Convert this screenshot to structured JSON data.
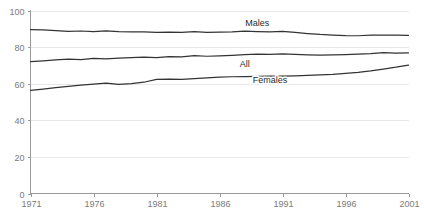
{
  "chart_data": {
    "type": "line",
    "title": "",
    "subtitle": "",
    "xlabel": "",
    "ylabel": "",
    "xlim": [
      1971,
      2001
    ],
    "ylim": [
      0,
      100
    ],
    "grid": true,
    "legend_position": "inline-labels",
    "y_ticks": [
      0,
      20,
      40,
      60,
      80,
      100
    ],
    "y_tick_labels": [
      "0",
      "20",
      "40",
      "60",
      "80",
      "100"
    ],
    "x_ticks": [
      1971,
      1976,
      1981,
      1986,
      1991,
      1996,
      2001
    ],
    "x_tick_labels": [
      "1971",
      "1976",
      "1981",
      "1986",
      "1991",
      "1996",
      "2001"
    ],
    "x": [
      1971,
      1972,
      1973,
      1974,
      1975,
      1976,
      1977,
      1978,
      1979,
      1980,
      1981,
      1982,
      1983,
      1984,
      1985,
      1986,
      1987,
      1988,
      1989,
      1990,
      1991,
      1992,
      1993,
      1994,
      1995,
      1996,
      1997,
      1998,
      1999,
      2000,
      2001
    ],
    "series": [
      {
        "name": "Males",
        "label": "Males",
        "color": "#333333",
        "label_x": 1989,
        "label_y": 93,
        "values": [
          89.6,
          89.4,
          89.0,
          88.6,
          88.8,
          88.5,
          88.9,
          88.4,
          88.3,
          88.3,
          88.1,
          88.2,
          88.0,
          88.4,
          88.0,
          88.2,
          88.3,
          88.7,
          88.5,
          88.3,
          88.6,
          88.0,
          87.4,
          86.9,
          86.6,
          86.3,
          86.2,
          86.5,
          86.6,
          86.5,
          86.4
        ]
      },
      {
        "name": "All",
        "label": "All",
        "color": "#333333",
        "label_x": 1988,
        "label_y": 71,
        "values": [
          72.1,
          72.5,
          73.0,
          73.4,
          73.2,
          73.8,
          73.6,
          74.0,
          74.2,
          74.5,
          74.3,
          74.8,
          74.6,
          75.3,
          75.0,
          75.2,
          75.5,
          75.9,
          76.2,
          76.0,
          76.3,
          76.0,
          75.8,
          75.6,
          75.7,
          75.9,
          76.1,
          76.4,
          77.0,
          76.7,
          76.9
        ]
      },
      {
        "name": "Females",
        "label": "Females",
        "color": "#333333",
        "label_x": 1990,
        "label_y": 62,
        "values": [
          56.3,
          57.1,
          57.9,
          58.6,
          59.2,
          59.8,
          60.3,
          59.6,
          60.1,
          60.8,
          62.4,
          62.5,
          62.3,
          62.8,
          63.2,
          63.6,
          63.8,
          63.9,
          64.0,
          64.1,
          64.2,
          64.3,
          64.5,
          64.8,
          65.1,
          65.6,
          66.2,
          67.0,
          68.0,
          69.0,
          70.2
        ]
      }
    ]
  }
}
